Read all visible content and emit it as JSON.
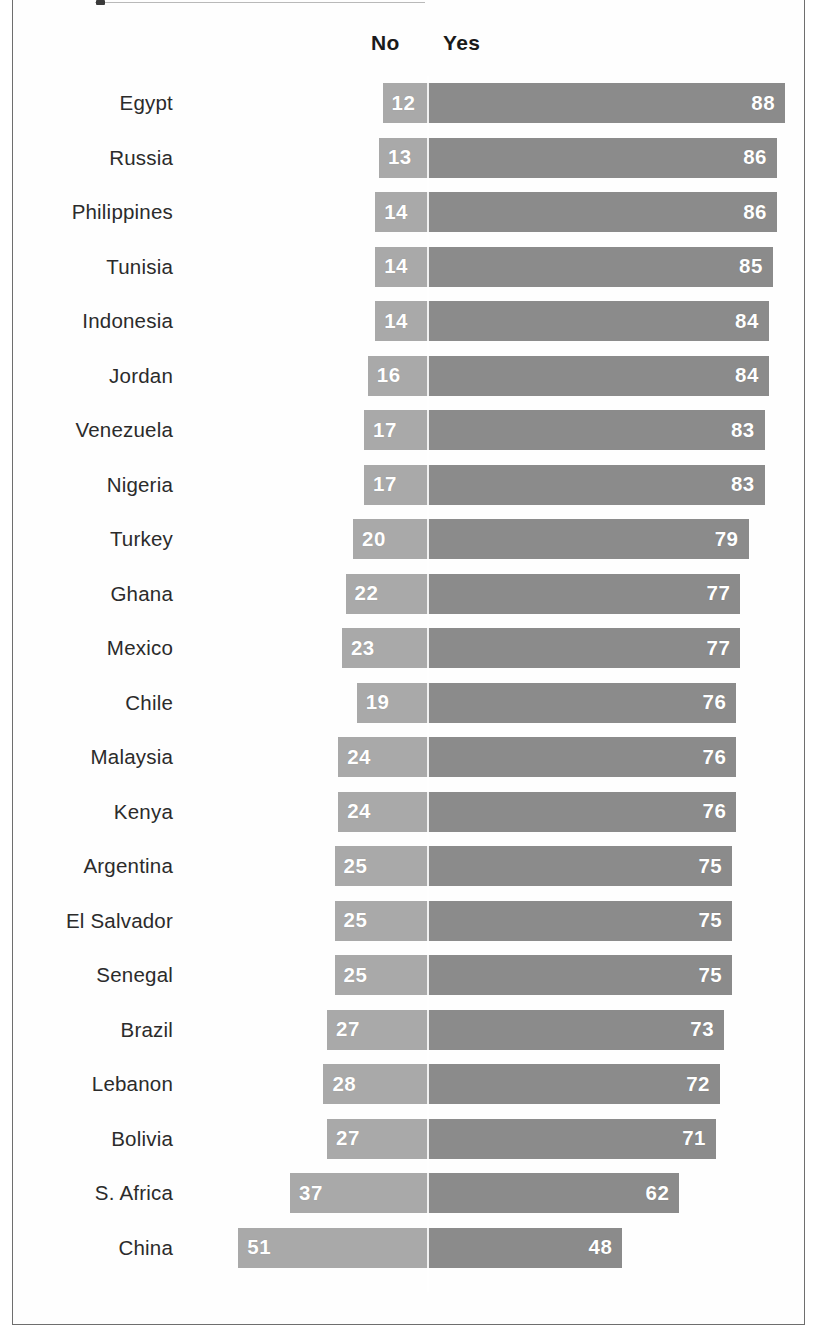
{
  "legend": {
    "no_label": "No",
    "yes_label": "Yes"
  },
  "colors": {
    "no_bar": "#a9a9a9",
    "yes_bar": "#8b8b8b",
    "value_text": "#ffffff",
    "label_text": "#2b2b2b",
    "frame": "#6e6e6e",
    "background": "#ffffff"
  },
  "chart_data": {
    "type": "bar",
    "title": "",
    "subtitle": "",
    "xlabel": "",
    "ylabel": "",
    "orientation": "horizontal",
    "stacked": true,
    "diverging": true,
    "grid": false,
    "legend_position": "top",
    "axis_units": "percent",
    "xlim": [
      -55,
      95
    ],
    "categories": [
      "Egypt",
      "Russia",
      "Philippines",
      "Tunisia",
      "Indonesia",
      "Jordan",
      "Venezuela",
      "Nigeria",
      "Turkey",
      "Ghana",
      "Mexico",
      "Chile",
      "Malaysia",
      "Kenya",
      "Argentina",
      "El Salvador",
      "Senegal",
      "Brazil",
      "Lebanon",
      "Bolivia",
      "S. Africa",
      "China"
    ],
    "series": [
      {
        "name": "No",
        "values": [
          12,
          13,
          14,
          14,
          14,
          16,
          17,
          17,
          20,
          22,
          23,
          19,
          24,
          24,
          25,
          25,
          25,
          27,
          28,
          27,
          37,
          51
        ]
      },
      {
        "name": "Yes",
        "values": [
          88,
          86,
          86,
          85,
          84,
          84,
          83,
          83,
          79,
          77,
          77,
          76,
          76,
          76,
          75,
          75,
          75,
          73,
          72,
          71,
          62,
          48
        ]
      }
    ]
  },
  "rows": [
    {
      "country": "Egypt",
      "no": 12,
      "yes": 88
    },
    {
      "country": "Russia",
      "no": 13,
      "yes": 86
    },
    {
      "country": "Philippines",
      "no": 14,
      "yes": 86
    },
    {
      "country": "Tunisia",
      "no": 14,
      "yes": 85
    },
    {
      "country": "Indonesia",
      "no": 14,
      "yes": 84
    },
    {
      "country": "Jordan",
      "no": 16,
      "yes": 84
    },
    {
      "country": "Venezuela",
      "no": 17,
      "yes": 83
    },
    {
      "country": "Nigeria",
      "no": 17,
      "yes": 83
    },
    {
      "country": "Turkey",
      "no": 20,
      "yes": 79
    },
    {
      "country": "Ghana",
      "no": 22,
      "yes": 77
    },
    {
      "country": "Mexico",
      "no": 23,
      "yes": 77
    },
    {
      "country": "Chile",
      "no": 19,
      "yes": 76
    },
    {
      "country": "Malaysia",
      "no": 24,
      "yes": 76
    },
    {
      "country": "Kenya",
      "no": 24,
      "yes": 76
    },
    {
      "country": "Argentina",
      "no": 25,
      "yes": 75
    },
    {
      "country": "El Salvador",
      "no": 25,
      "yes": 75
    },
    {
      "country": "Senegal",
      "no": 25,
      "yes": 75
    },
    {
      "country": "Brazil",
      "no": 27,
      "yes": 73
    },
    {
      "country": "Lebanon",
      "no": 28,
      "yes": 72
    },
    {
      "country": "Bolivia",
      "no": 27,
      "yes": 71
    },
    {
      "country": "S. Africa",
      "no": 37,
      "yes": 62
    },
    {
      "country": "China",
      "no": 51,
      "yes": 48
    }
  ]
}
